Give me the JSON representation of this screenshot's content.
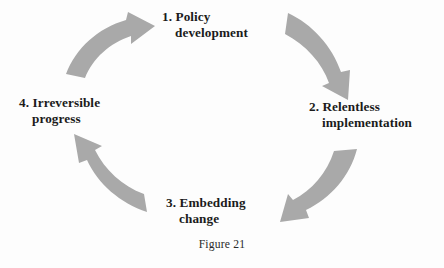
{
  "figure": {
    "caption": "Figure 21",
    "background_color": "#fdfdfd",
    "arrow_color": "#a9a9a9",
    "text_color": "#1b1b1b",
    "type": "cycle-diagram",
    "direction": "clockwise",
    "stage_count": 4
  },
  "stages": [
    {
      "number": "1.",
      "line1": "1. Policy",
      "line2": "development",
      "full_text": "1. Policy development",
      "position": "top"
    },
    {
      "number": "2.",
      "line1": "2. Relentless",
      "line2": "implementation",
      "full_text": "2. Relentless implementation",
      "position": "right"
    },
    {
      "number": "3.",
      "line1": "3. Embedding",
      "line2": "change",
      "full_text": "3. Embedding change",
      "position": "bottom"
    },
    {
      "number": "4.",
      "line1": "4. Irreversible",
      "line2": "progress",
      "full_text": "4. Irreversible progress",
      "position": "left"
    }
  ],
  "arrows": [
    {
      "name": "arrow-to-stage-1",
      "from": "4. Irreversible progress",
      "to": "1. Policy development",
      "quadrant": "top-left",
      "points": "up-right"
    },
    {
      "name": "arrow-to-stage-2",
      "from": "1. Policy development",
      "to": "2. Relentless implementation",
      "quadrant": "top-right",
      "points": "down-right"
    },
    {
      "name": "arrow-to-stage-3",
      "from": "2. Relentless implementation",
      "to": "3. Embedding change",
      "quadrant": "bottom-right",
      "points": "down-left"
    },
    {
      "name": "arrow-to-stage-4",
      "from": "3. Embedding change",
      "to": "4. Irreversible progress",
      "quadrant": "bottom-left",
      "points": "up-left"
    }
  ]
}
